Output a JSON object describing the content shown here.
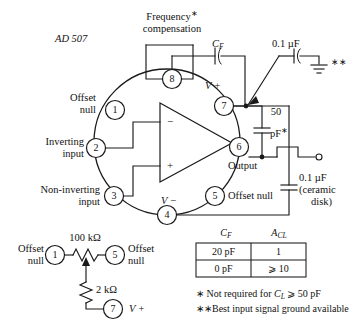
{
  "figure": {
    "device_label": "AD 507",
    "title_note": "Frequency compensation and offset null connections for AD 507 operational amplifier"
  },
  "labels": {
    "frequency": "Frequency",
    "compensation": "compensation",
    "cf_symbol": "C",
    "cf_sub": "F",
    "cap_tap": "0.1 µF",
    "double_star": "∗∗",
    "vplus": "V +",
    "vminus": "V −",
    "offset_null_1a": "Offset",
    "offset_null_1b": "null",
    "inverting_a": "Inverting",
    "inverting_b": "input",
    "noninverting_a": "Non-inverting",
    "noninverting_b": "input",
    "offset_null_5": "Offset null",
    "output": "Output",
    "cap50_a": "50",
    "cap50_b": "pF",
    "cap50_star": "∗",
    "freq_star": "∗",
    "out_cap_a": "0.1 µF",
    "out_cap_b": "(ceramic",
    "out_cap_c": "disk)",
    "minus_input": "−",
    "plus_input": "+"
  },
  "pins": {
    "p1": "1",
    "p2": "2",
    "p3": "3",
    "p4": "4",
    "p5": "5",
    "p6": "6",
    "p7": "7",
    "p8": "8"
  },
  "trimmer": {
    "r_top": "100 kΩ",
    "r_bottom": "2 kΩ",
    "offset_a": "Offset",
    "offset_b": "null",
    "offset_right_a": "Offset",
    "offset_right_b": "null",
    "pin_left": "1",
    "pin_right": "5",
    "pin_bottom": "7",
    "vplus": "V +"
  },
  "table": {
    "header_cf": "C",
    "header_cf_sub": "F",
    "header_acl": "A",
    "header_acl_sub": "CL",
    "rows": [
      {
        "cf": "20 pF",
        "acl": "1"
      },
      {
        "cf": "0 pF",
        "acl": "⩾ 10"
      }
    ]
  },
  "footnotes": {
    "star": "∗",
    "note1_a": "Not required for ",
    "note1_cl": "C",
    "note1_cl_sub": "L",
    "note1_b": " ⩾ 50 pF",
    "doublestar": "∗∗",
    "note2": "Best input signal ground available"
  },
  "colors": {
    "ink": "#1a1a1a",
    "paper": "#ffffff"
  }
}
